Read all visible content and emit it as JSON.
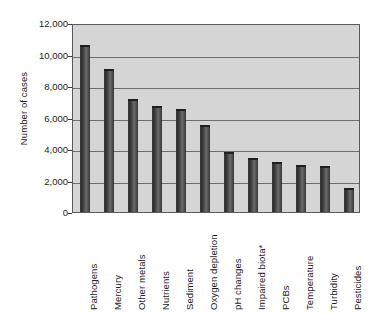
{
  "chart_data": {
    "type": "bar",
    "title": "",
    "xlabel": "",
    "ylabel": "Number of cases",
    "ylim": [
      0,
      12000
    ],
    "ytick_labels": [
      "12,000",
      "10,000",
      "8,000",
      "6,000",
      "4,000",
      "2,000",
      "0"
    ],
    "ytick_values": [
      12000,
      10000,
      8000,
      6000,
      4000,
      2000,
      0
    ],
    "grid": true,
    "legend": "none",
    "categories": [
      "Pathogens",
      "Mercury",
      "Other metals",
      "Nutrients",
      "Sediment",
      "Oxygen depletion",
      "pH changes",
      "Impaired biota*",
      "PCBs",
      "Temperature",
      "Turbidity",
      "Pesticides"
    ],
    "values": [
      10600,
      9100,
      7150,
      6750,
      6550,
      5500,
      3800,
      3450,
      3200,
      3000,
      2900,
      1550
    ],
    "colors": {
      "bar": "#4a4a4a",
      "plot_background": "#d5d5d5",
      "gridline": "#6f6f6f",
      "axis": "#3a3a3a",
      "text": "#1c1c1c",
      "page_background": "#ffffff"
    }
  }
}
